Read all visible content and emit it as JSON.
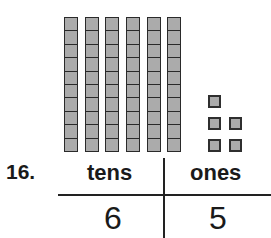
{
  "problem": {
    "number": "16.",
    "model": {
      "tens_rods": 6,
      "units_per_rod": 10,
      "ones_cubes": 5,
      "fill_color": "#ababab",
      "stroke_color": "#2a2a2a"
    },
    "chart": {
      "headers": {
        "tens": "tens",
        "ones": "ones"
      },
      "answers": {
        "tens": "6",
        "ones": "5"
      }
    }
  }
}
